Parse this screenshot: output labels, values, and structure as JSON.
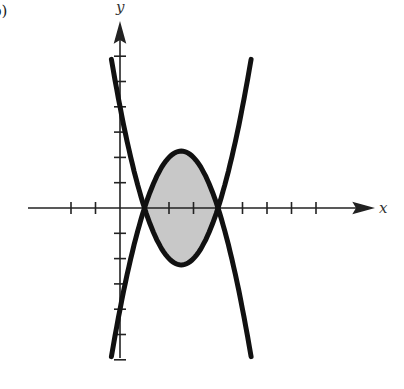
{
  "figure": {
    "subfigure_label": "b)",
    "x_axis_label": "x",
    "y_axis_label": "y"
  },
  "chart_data": {
    "type": "line",
    "title": "",
    "xlabel": "x",
    "ylabel": "y",
    "grid": false,
    "legend": "none",
    "x_ticks": [
      -2,
      -1,
      1,
      2,
      3,
      4,
      5,
      6,
      7,
      8
    ],
    "y_ticks": [
      -6,
      -5,
      -4,
      -3,
      -2,
      -1,
      1,
      2,
      3,
      4,
      5,
      6
    ],
    "xlim": [
      -3.6,
      10.2
    ],
    "ylim": [
      -6.0,
      7.2
    ],
    "series": [
      {
        "name": "y = x^2 - 5x + 4",
        "x_range": [
          -0.35,
          5.35
        ],
        "points": [
          [
            -0.35,
            5.87
          ],
          [
            0,
            4
          ],
          [
            1,
            0
          ],
          [
            2.5,
            -2.25
          ],
          [
            4,
            0
          ],
          [
            5.35,
            5.87
          ]
        ]
      },
      {
        "name": "y = -x^2 + 5x - 4",
        "x_range": [
          -0.35,
          5.35
        ],
        "points": [
          [
            -0.35,
            -5.87
          ],
          [
            0,
            -4
          ],
          [
            1,
            0
          ],
          [
            2.5,
            2.25
          ],
          [
            4,
            0
          ],
          [
            5.35,
            -5.87
          ]
        ]
      }
    ],
    "shaded_region": {
      "between": [
        "y = x^2 - 5x + 4",
        "y = -x^2 + 5x - 4"
      ],
      "x_from": 1,
      "x_to": 4,
      "fill": "#c8c8c8"
    },
    "intersections": [
      [
        1,
        0
      ],
      [
        4,
        0
      ]
    ]
  },
  "style": {
    "curve_color": "#111111",
    "axis_color": "#222222",
    "fill_color": "#c8c8c8"
  }
}
